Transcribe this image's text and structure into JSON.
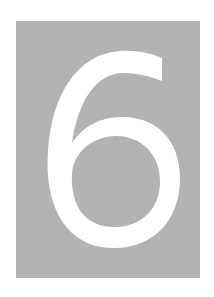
{
  "image": {
    "digit": "6",
    "background_color": "#b3b3b3",
    "digit_color": "#ffffff"
  }
}
